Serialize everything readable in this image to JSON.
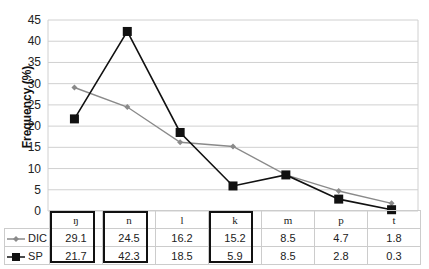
{
  "chart_data": {
    "type": "line",
    "title": "",
    "xlabel": "",
    "ylabel": "Frequency (%)",
    "ylim": [
      0,
      45
    ],
    "yticks": [
      0,
      5,
      10,
      15,
      20,
      25,
      30,
      35,
      40,
      45
    ],
    "grid": true,
    "legend_position": "data-table-left",
    "categories": [
      "ŋ",
      "n",
      "l",
      "k",
      "m",
      "p",
      "t"
    ],
    "highlighted_categories": [
      "ŋ",
      "n",
      "k"
    ],
    "series": [
      {
        "name": "DIC",
        "values": [
          29.1,
          24.5,
          16.2,
          15.2,
          8.5,
          4.7,
          1.8
        ],
        "color": "#8a8a8a",
        "marker": "diamond"
      },
      {
        "name": "SP",
        "values": [
          21.7,
          42.3,
          18.5,
          5.9,
          8.5,
          2.8,
          0.3
        ],
        "color": "#111111",
        "marker": "square"
      }
    ]
  },
  "table": {
    "rows": [
      {
        "label": "DIC",
        "cells": [
          "29.1",
          "24.5",
          "16.2",
          "15.2",
          "8.5",
          "4.7",
          "1.8"
        ]
      },
      {
        "label": "SP",
        "cells": [
          "21.7",
          "42.3",
          "18.5",
          "5.9",
          "8.5",
          "2.8",
          "0.3"
        ]
      }
    ]
  }
}
